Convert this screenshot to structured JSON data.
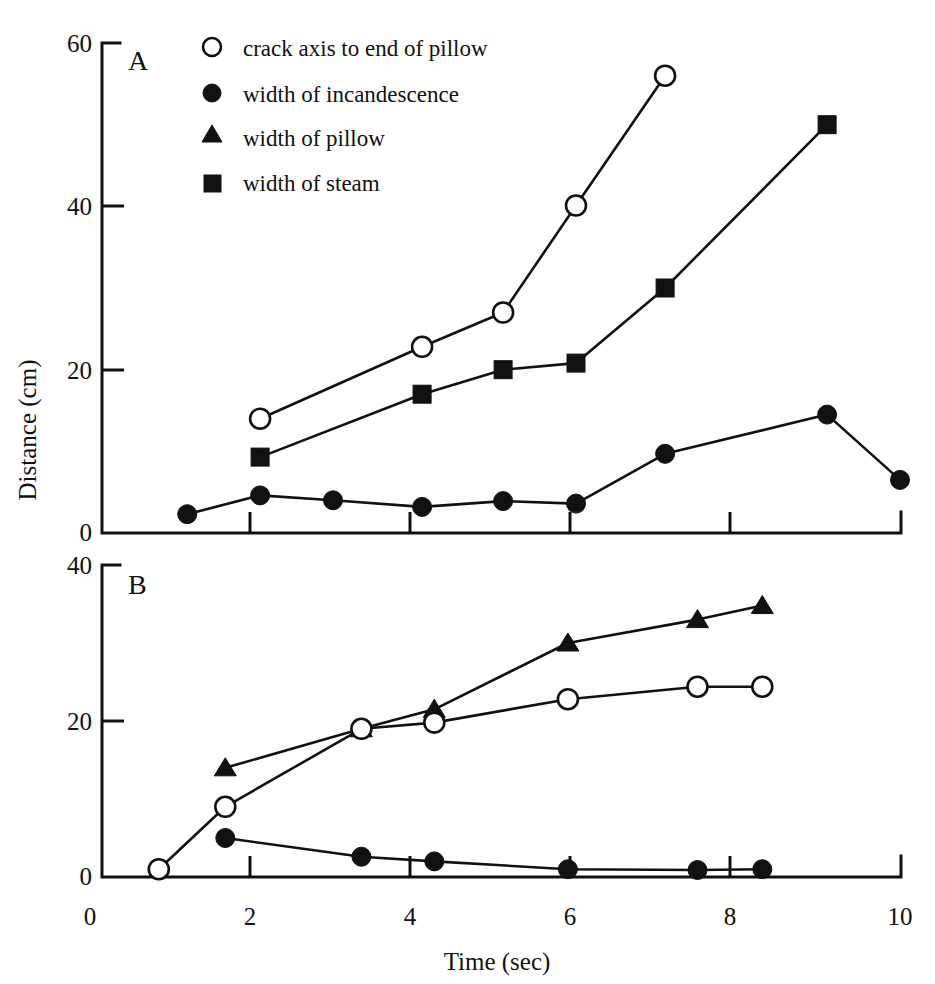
{
  "figure": {
    "panels": [
      "A",
      "B"
    ],
    "x_axis_title": "Time (sec)",
    "y_axis_title": "Distance (cm)"
  },
  "legend": {
    "entries": [
      {
        "marker": "open-circle-icon",
        "label": "crack axis to end of pillow"
      },
      {
        "marker": "filled-circle-icon",
        "label": "width of incandescence"
      },
      {
        "marker": "filled-triangle-icon",
        "label": "width of pillow"
      },
      {
        "marker": "filled-square-icon",
        "label": "width of steam"
      }
    ]
  },
  "axis_labels": {
    "panel_a_y": [
      "0",
      "20",
      "40",
      "60"
    ],
    "panel_b_y": [
      "0",
      "20",
      "40"
    ],
    "x": [
      "0",
      "2",
      "4",
      "6",
      "8",
      "10"
    ]
  },
  "chart_data": [
    {
      "type": "line",
      "panel": "A",
      "title": "A",
      "xlabel": "Time (sec)",
      "ylabel": "Distance (cm)",
      "xlim": [
        0,
        10
      ],
      "ylim": [
        0,
        60
      ],
      "xticks": [
        0,
        2,
        4,
        6,
        8,
        10
      ],
      "yticks": [
        0,
        20,
        40,
        60
      ],
      "grid": false,
      "legend_position": "top-left-inside",
      "series": [
        {
          "name": "crack axis to end of pillow",
          "marker": "open-circle",
          "points": [
            {
              "x": 2.1,
              "y": 14.0
            },
            {
              "x": 4.1,
              "y": 22.8
            },
            {
              "x": 5.1,
              "y": 27.0
            },
            {
              "x": 6.0,
              "y": 40.1
            },
            {
              "x": 7.1,
              "y": 56.0
            }
          ]
        },
        {
          "name": "width of steam",
          "marker": "filled-square",
          "points": [
            {
              "x": 2.1,
              "y": 9.3
            },
            {
              "x": 4.1,
              "y": 17.0
            },
            {
              "x": 5.1,
              "y": 20.0
            },
            {
              "x": 6.0,
              "y": 20.8
            },
            {
              "x": 7.1,
              "y": 30.0
            },
            {
              "x": 9.1,
              "y": 50.0
            }
          ]
        },
        {
          "name": "width of incandescence",
          "marker": "filled-circle",
          "points": [
            {
              "x": 1.2,
              "y": 2.3
            },
            {
              "x": 2.1,
              "y": 4.6
            },
            {
              "x": 3.0,
              "y": 4.0
            },
            {
              "x": 4.1,
              "y": 3.2
            },
            {
              "x": 5.1,
              "y": 3.9
            },
            {
              "x": 6.0,
              "y": 3.6
            },
            {
              "x": 7.1,
              "y": 9.7
            },
            {
              "x": 9.1,
              "y": 14.5
            },
            {
              "x": 10.0,
              "y": 6.5
            }
          ]
        }
      ]
    },
    {
      "type": "line",
      "panel": "B",
      "title": "B",
      "xlabel": "Time (sec)",
      "ylabel": "Distance (cm)",
      "xlim": [
        0,
        10
      ],
      "ylim": [
        0,
        40
      ],
      "xticks": [
        0,
        2,
        4,
        6,
        8,
        10
      ],
      "yticks": [
        0,
        20,
        40
      ],
      "grid": false,
      "legend_position": "none",
      "series": [
        {
          "name": "width of pillow",
          "marker": "filled-triangle",
          "points": [
            {
              "x": 1.67,
              "y": 14.0
            },
            {
              "x": 3.35,
              "y": 19.0
            },
            {
              "x": 4.25,
              "y": 21.5
            },
            {
              "x": 5.9,
              "y": 30.0
            },
            {
              "x": 7.5,
              "y": 33.0
            },
            {
              "x": 8.3,
              "y": 34.8
            }
          ]
        },
        {
          "name": "crack axis to end of pillow",
          "marker": "open-circle",
          "points": [
            {
              "x": 0.85,
              "y": 1.0
            },
            {
              "x": 1.67,
              "y": 9.0
            },
            {
              "x": 3.35,
              "y": 19.0
            },
            {
              "x": 4.25,
              "y": 19.8
            },
            {
              "x": 5.9,
              "y": 22.8
            },
            {
              "x": 7.5,
              "y": 24.4
            },
            {
              "x": 8.3,
              "y": 24.4
            }
          ]
        },
        {
          "name": "width of incandescence",
          "marker": "filled-circle",
          "points": [
            {
              "x": 1.67,
              "y": 5.0
            },
            {
              "x": 3.35,
              "y": 2.6
            },
            {
              "x": 4.25,
              "y": 2.0
            },
            {
              "x": 5.9,
              "y": 1.0
            },
            {
              "x": 7.5,
              "y": 0.9
            },
            {
              "x": 8.3,
              "y": 1.0
            }
          ]
        }
      ]
    }
  ]
}
